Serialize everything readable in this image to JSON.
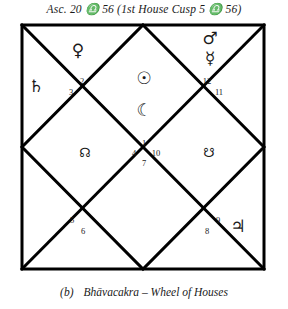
{
  "title": {
    "text": "Asc. 20 ♎ 56 (1st House Cusp 5 ♎ 56)"
  },
  "caption": {
    "label": "(b)",
    "text": "Bhāvacakra – Wheel of Houses"
  },
  "chart": {
    "type": "north-indian-bhava-chakra",
    "frame": {
      "x": 22,
      "y": 25,
      "width": 242,
      "height": 244
    },
    "line_color": "#000000",
    "background": "#ffffff",
    "planets": [
      {
        "name": "saturn-glyph",
        "symbol": "♄",
        "label": "Saturn",
        "x": 36,
        "y": 86,
        "size": "planet"
      },
      {
        "name": "venus-glyph",
        "symbol": "♀",
        "label": "Venus",
        "x": 78,
        "y": 50,
        "size": "planet"
      },
      {
        "name": "mars-glyph",
        "symbol": "♂",
        "label": "Mars",
        "x": 210,
        "y": 38,
        "size": "planet"
      },
      {
        "name": "mercury-glyph",
        "symbol": "☿",
        "label": "Mercury",
        "x": 210,
        "y": 58,
        "size": "planet"
      },
      {
        "name": "sun-glyph",
        "symbol": "☉",
        "label": "Sun",
        "x": 144,
        "y": 78,
        "size": "planet"
      },
      {
        "name": "moon-glyph",
        "symbol": "☾",
        "label": "Moon",
        "x": 144,
        "y": 110,
        "size": "planet"
      },
      {
        "name": "rahu-glyph",
        "symbol": "☊",
        "label": "Rahu",
        "x": 85,
        "y": 152,
        "size": "node"
      },
      {
        "name": "ketu-glyph",
        "symbol": "☋",
        "label": "Ketu",
        "x": 209,
        "y": 152,
        "size": "node"
      },
      {
        "name": "jupiter-glyph",
        "symbol": "♃",
        "label": "Jupiter",
        "x": 238,
        "y": 226,
        "size": "planet"
      }
    ],
    "house_numbers": [
      {
        "name": "house-number-2",
        "value": "2",
        "x": 82,
        "y": 81
      },
      {
        "name": "house-number-3",
        "value": "3",
        "x": 71,
        "y": 92
      },
      {
        "name": "house-number-12",
        "value": "12",
        "x": 207,
        "y": 81
      },
      {
        "name": "house-number-11",
        "value": "11",
        "x": 219,
        "y": 92
      },
      {
        "name": "house-number-1",
        "value": "1",
        "x": 144,
        "y": 143
      },
      {
        "name": "house-number-4",
        "value": "4",
        "x": 134,
        "y": 153
      },
      {
        "name": "house-number-10",
        "value": "10",
        "x": 156,
        "y": 153
      },
      {
        "name": "house-number-7",
        "value": "7",
        "x": 144,
        "y": 163
      },
      {
        "name": "house-number-5",
        "value": "5",
        "x": 72,
        "y": 220
      },
      {
        "name": "house-number-6",
        "value": "6",
        "x": 83,
        "y": 231
      },
      {
        "name": "house-number-9",
        "value": "9",
        "x": 218,
        "y": 220
      },
      {
        "name": "house-number-8",
        "value": "8",
        "x": 207,
        "y": 231
      }
    ]
  }
}
